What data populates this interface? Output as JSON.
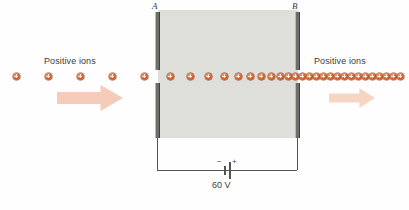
{
  "figure": {
    "name": "parallel-plate-accelerator-diagram",
    "width": 409,
    "height": 210,
    "background_color": "#fefefe"
  },
  "field_region": {
    "label": "field-region",
    "fill_color": "#dededa",
    "x": 158,
    "y": 10,
    "width": 140,
    "height": 128
  },
  "plates": [
    {
      "id": "plate-a",
      "letter": "A",
      "x": 155,
      "top_segment": {
        "y": 12,
        "height": 58
      },
      "bottom_segment": {
        "y": 83,
        "height": 55
      },
      "width": 5,
      "color": "#6e6e6b",
      "label_x": 152,
      "label_y": 1
    },
    {
      "id": "plate-b",
      "letter": "B",
      "x": 295,
      "top_segment": {
        "y": 12,
        "height": 58
      },
      "bottom_segment": {
        "y": 83,
        "height": 55
      },
      "width": 5,
      "color": "#6e6e6b",
      "label_x": 292,
      "label_y": 1
    }
  ],
  "labels": {
    "left_caption": "Positive ions",
    "right_caption": "Positive ions",
    "left_caption_x": 44,
    "left_caption_y": 56,
    "right_caption_x": 314,
    "right_caption_y": 56
  },
  "ions": {
    "semantic_name": "positive-ion",
    "diameter": 7,
    "center_y": 76,
    "color": "#d2622f",
    "x_positions": [
      16,
      48,
      80,
      112,
      144,
      170,
      190,
      208,
      224,
      238,
      250,
      261,
      271,
      280,
      288,
      295,
      302,
      309,
      316,
      323,
      330,
      337,
      344,
      351,
      358,
      365,
      372,
      379,
      386,
      393,
      400
    ]
  },
  "arrows": [
    {
      "id": "left-flow-arrow",
      "x": 57,
      "y": 85,
      "width": 66,
      "height": 26,
      "fill": "#f5cbba",
      "direction": "right"
    },
    {
      "id": "right-flow-arrow",
      "x": 329,
      "y": 88,
      "width": 46,
      "height": 20,
      "fill": "#f7d5c5",
      "direction": "right"
    }
  ],
  "circuit": {
    "wire_color": "#53534f",
    "left_wire": {
      "x": 157,
      "y_top": 138,
      "y_bottom": 170
    },
    "right_wire": {
      "x": 297,
      "y_top": 138,
      "y_bottom": 170
    },
    "bottom_wire": {
      "y": 170,
      "x_left": 157,
      "x_right": 297
    },
    "battery": {
      "id": "battery-symbol",
      "negative_sign": "−",
      "positive_sign": "+",
      "voltage_label": "60 V",
      "negative_plate_x": 224,
      "positive_plate_x": 229,
      "center_x": 226,
      "sign_y": 157,
      "voltage_x": 212,
      "voltage_y": 180
    }
  }
}
